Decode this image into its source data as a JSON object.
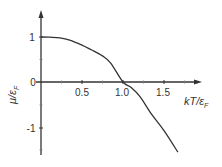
{
  "chart_data": {
    "type": "line",
    "title": "",
    "xlabel": "kT/ε_F",
    "ylabel": "μ/ε_F",
    "xlim": [
      0,
      1.9
    ],
    "ylim": [
      -1.6,
      1.5
    ],
    "x_ticks": [
      0.25,
      0.5,
      0.75,
      1.0,
      1.25,
      1.5,
      1.75
    ],
    "x_tick_labels": [
      "0.5",
      "1.0",
      "1.5"
    ],
    "y_ticks": [
      -1.5,
      -1,
      -0.5,
      0,
      0.5,
      1
    ],
    "y_tick_labels": [
      "1",
      "0",
      "-1"
    ],
    "grid": false,
    "legend": null,
    "series": [
      {
        "name": "chemical potential",
        "x": [
          0,
          0.1,
          0.23,
          0.35,
          0.5,
          0.62,
          0.75,
          0.85,
          1.0,
          1.1,
          1.21,
          1.35,
          1.5,
          1.67
        ],
        "values": [
          1.0,
          0.995,
          0.98,
          0.93,
          0.82,
          0.71,
          0.58,
          0.42,
          0.0,
          -0.12,
          -0.33,
          -0.72,
          -1.08,
          -1.56
        ]
      }
    ],
    "color": "#333333"
  },
  "labels": {
    "y_axis_main": "μ/ε",
    "y_axis_sub": "F",
    "x_axis_main": "kT/ε",
    "x_axis_sub": "F",
    "y_tick_1": "1",
    "y_tick_0": "0",
    "y_tick_m1": "-1",
    "x_tick_05": "0.5",
    "x_tick_10": "1.0",
    "x_tick_15": "1.5"
  }
}
